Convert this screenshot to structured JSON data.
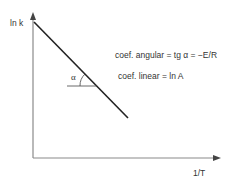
{
  "diagram": {
    "y_axis_label": "ln k",
    "x_axis_label": "1/T",
    "angle_label": "α",
    "slope_text": "coef. angular = tg α = −E/R",
    "intercept_text": "coef. linear = ln A",
    "line_color": "#222222",
    "axis_color": "#888888"
  }
}
